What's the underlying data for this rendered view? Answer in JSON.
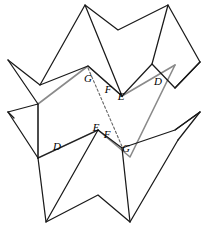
{
  "figure": {
    "width": 210,
    "height": 230,
    "background_color": "#ffffff",
    "stroke_black": "#1a1a1a",
    "stroke_gray": "#8a8a8a",
    "dash_color": "#666666",
    "label_color": "#000000"
  },
  "labels": [
    {
      "id": "g-upper",
      "text": "G",
      "x": 88,
      "y": 79
    },
    {
      "id": "f-upper",
      "text": "F",
      "x": 108,
      "y": 90
    },
    {
      "id": "e-upper",
      "text": "E",
      "x": 121,
      "y": 97
    },
    {
      "id": "d-upper-right",
      "text": "D",
      "x": 158,
      "y": 82
    },
    {
      "id": "e-lower",
      "text": "E",
      "x": 96,
      "y": 128
    },
    {
      "id": "f-lower",
      "text": "F",
      "x": 107,
      "y": 135
    },
    {
      "id": "g-lower",
      "text": "G",
      "x": 126,
      "y": 149
    },
    {
      "id": "d-lower-left",
      "text": "D",
      "x": 57,
      "y": 147
    }
  ],
  "black_polylines": [
    {
      "id": "top-zigzag-outer",
      "points": "8,60 40,85 88,66 122,96 152,64 175,88 200,62"
    },
    {
      "id": "top-peak-chain",
      "points": "40,85 85,5 118,30 168,5 200,62"
    },
    {
      "id": "top-inner-left",
      "points": "8,60 38,104"
    },
    {
      "id": "top-inner-mid",
      "points": "85,5 122,96"
    },
    {
      "id": "top-inner-right",
      "points": "168,5 152,64"
    },
    {
      "id": "top-spur-right",
      "points": "175,88 200,62"
    },
    {
      "id": "mid-left-chain",
      "points": "8,112 38,104 38,158"
    },
    {
      "id": "mid-left-down",
      "points": "8,112 38,158"
    },
    {
      "id": "bottom-zigzag-outer",
      "points": "38,158 98,130 122,148 175,130 200,112"
    },
    {
      "id": "bottom-valley-chain",
      "points": "38,158 46,222 98,195 130,222 178,140"
    },
    {
      "id": "bottom-inner-left",
      "points": "98,130 46,222"
    },
    {
      "id": "bottom-inner-mid",
      "points": "122,148 130,222"
    },
    {
      "id": "bottom-inner-right",
      "points": "175,130 200,112"
    },
    {
      "id": "bottom-right-spur",
      "points": "178,140 200,112"
    },
    {
      "id": "left-lower-spur",
      "points": "8,112 14,118"
    }
  ],
  "gray_polylines": [
    {
      "id": "gray-upper-zigzag",
      "points": "38,104 88,66 122,96 175,65"
    },
    {
      "id": "gray-lower-zigzag",
      "points": "38,158 98,130 130,157 175,65"
    },
    {
      "id": "gray-left-edge",
      "points": "38,104 38,158"
    }
  ],
  "dashed_lines": [
    {
      "id": "dashed-diagonal",
      "x1": 88,
      "y1": 68,
      "x2": 124,
      "y2": 151
    }
  ],
  "notes": {
    "pattern": "zigzag",
    "gray_region": "parallelogram band",
    "label_set": "D, E, F, G"
  }
}
